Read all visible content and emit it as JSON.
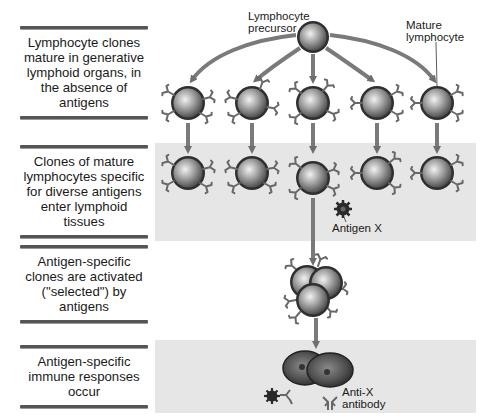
{
  "figure": {
    "stages": [
      {
        "id": "maturation",
        "text": "Lymphocyte clones mature in generative lymphoid organs, in the absence of antigens"
      },
      {
        "id": "entry",
        "text": "Clones of mature lymphocytes specific for diverse antigens enter lymphoid tissues"
      },
      {
        "id": "selection",
        "text": "Antigen-specific clones are activated (\"selected\") by antigens"
      },
      {
        "id": "response",
        "text": "Antigen-specific immune responses occur"
      }
    ],
    "labels": {
      "precursor": "Lymphocyte precursor",
      "precursor_line1": "Lymphocyte",
      "precursor_line2": "precursor",
      "mature_line1": "Mature",
      "mature_line2": "lymphocyte",
      "antigen": "Antigen X",
      "antibody_line1": "Anti-X",
      "antibody_line2": "antibody"
    },
    "clone_count": 5,
    "colors": {
      "band": "#e6e6e6",
      "arrow": "#7a7a7a",
      "cell_rim": "#3a3a3a",
      "receptor": "#6a6a6a",
      "antigen": "#2a2a2a"
    }
  }
}
